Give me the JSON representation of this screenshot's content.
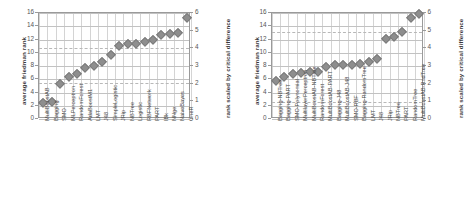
{
  "figure": {
    "panels": [
      {
        "id": "left",
        "ylabel_left": "average friedman rank",
        "ylabel_right": "rank scaled by critical difference",
        "yticks_left": [
          "0",
          "2",
          "4",
          "6",
          "8",
          "10",
          "12",
          "14",
          "16"
        ],
        "yticks_right": [
          "0",
          "1",
          "2",
          "3",
          "4",
          "5",
          "6"
        ]
      },
      {
        "id": "right",
        "ylabel_left": "average friedman rank",
        "ylabel_right": "rank scaled by critical difference",
        "yticks_left": [
          "0",
          "2",
          "4",
          "6",
          "8",
          "10",
          "12",
          "14",
          "16"
        ],
        "yticks_right": [
          "0",
          "1",
          "2",
          "3",
          "4",
          "5",
          "6"
        ]
      }
    ]
  },
  "chart_data": [
    {
      "type": "scatter",
      "id": "left-panel-base-classifiers",
      "title": "",
      "xlabel": "",
      "ylabel": "average friedman rank",
      "ylabel_secondary": "rank scaled by critical difference",
      "ylim": [
        0,
        16
      ],
      "ylim_secondary": [
        0,
        6
      ],
      "ytick_step": 2,
      "ytick_step_secondary": 1,
      "grid": true,
      "legend": "none",
      "marker": "diamond",
      "marker_color": "#8e8e8e",
      "reference_lines": [
        10.7,
        5.5
      ],
      "categories": [
        "MultiBoostAB",
        "Bagging",
        "SMO",
        "MLPerceptron",
        "RandomForest",
        "AdaBoostM1",
        "LMT",
        "J48",
        "SimpleLogistic",
        "JRip",
        "NBTree",
        "Logistic",
        "RBFNetwork",
        "PART",
        "IBk",
        "NNge",
        "NaiveBayes",
        "OneR"
      ],
      "values": [
        2.45,
        2.5,
        5.3,
        6.4,
        6.85,
        7.65,
        7.95,
        8.6,
        9.6,
        11.0,
        11.3,
        11.3,
        11.65,
        11.85,
        12.75,
        12.85,
        12.95,
        15.3
      ]
    },
    {
      "type": "scatter",
      "id": "right-panel-ensemble-classifiers",
      "title": "",
      "xlabel": "",
      "ylabel": "average friedman rank",
      "ylabel_secondary": "rank scaled by critical difference",
      "ylim": [
        0,
        16
      ],
      "ylim_secondary": [
        0,
        6
      ],
      "ytick_step": 2,
      "ytick_step_secondary": 1,
      "grid": true,
      "legend": "none",
      "marker": "diamond",
      "marker_color": "#8e8e8e",
      "reference_lines": [
        13.2,
        2.5
      ],
      "categories": [
        "Bagging-NBTree",
        "Bagging-PART",
        "SMO-Polynomial",
        "MultilayerPerceptron",
        "MultiBoostAB-NBTree",
        "RandomForest",
        "MultiBoostAB-PART",
        "Bagging-J48",
        "MultiBoostAB-J48",
        "SMO-RBF",
        "Bagging-RandomTree",
        "LMT",
        "J48",
        "JRip",
        "NBTree",
        "PART",
        "RandomTree",
        "MultiBoostAB-RndTree"
      ],
      "values": [
        5.75,
        6.4,
        6.75,
        7.0,
        7.05,
        7.1,
        7.85,
        8.1,
        8.15,
        8.2,
        8.25,
        8.6,
        9.1,
        12.1,
        12.35,
        13.2,
        15.25,
        15.9
      ]
    }
  ]
}
